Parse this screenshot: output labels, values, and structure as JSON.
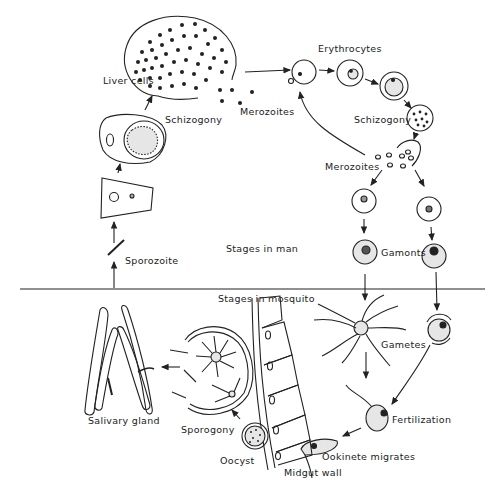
{
  "diagram": {
    "divider_labels": {
      "man": "Stages in man",
      "mosquito": "Stages in mosquito"
    },
    "labels": {
      "liver_cells": "Liver cells",
      "schizogony_liver": "Schizogony",
      "merozoites_liver": "Merozoites",
      "erythrocytes": "Erythrocytes",
      "schizogony_blood": "Schizogony",
      "merozoites_blood": "Merozoites",
      "gamonts": "Gamonts",
      "sporozoite": "Sporozoite",
      "gametes": "Gametes",
      "fertilization": "Fertilization",
      "ookinete_migrates": "Ookinete migrates",
      "midgut_wall": "Midgut wall",
      "oocyst": "Oocyst",
      "sporogony": "Sporogony",
      "salivary_gland": "Salivary gland"
    },
    "colors": {
      "line": "#222222",
      "fill_stipple": "#e6e6e6",
      "background": "#ffffff"
    }
  }
}
